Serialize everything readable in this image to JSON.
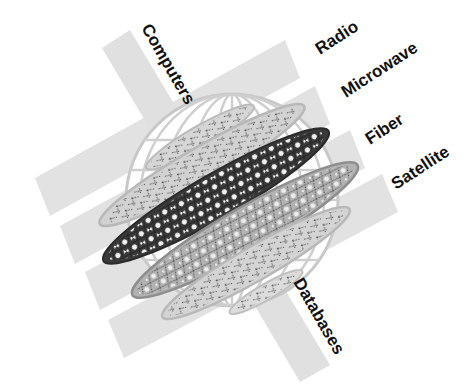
{
  "diagram": {
    "type": "network-globe",
    "colors": {
      "band": "#e2e2e2",
      "globe_lines": "#c8c8c8",
      "layer_light": "#d4d4d4",
      "layer_mid": "#b4b4b4",
      "layer_dark": "#3a3a3a",
      "node": "#f4f4f4",
      "text": "#111111"
    },
    "transmission_bands": [
      {
        "label": "Radio"
      },
      {
        "label": "Microwave"
      },
      {
        "label": "Fiber"
      },
      {
        "label": "Satellite"
      }
    ],
    "cross_band": {
      "top_label": "Computers",
      "bottom_label": "Databases"
    },
    "layers": [
      {
        "shade": "light",
        "style": "dashed-links"
      },
      {
        "shade": "light",
        "style": "dashed-links"
      },
      {
        "shade": "dark",
        "style": "nodes"
      },
      {
        "shade": "mid",
        "style": "nodes"
      },
      {
        "shade": "light",
        "style": "dashed-links"
      },
      {
        "shade": "light",
        "style": "dashed-links"
      }
    ]
  }
}
